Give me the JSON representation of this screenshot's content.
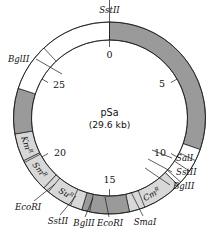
{
  "figure": {
    "kind": "plasmid-map",
    "name": "pSa",
    "size_label": "(29.6 kb)",
    "units": "kb",
    "total_kb": 29.6,
    "scale_max": 30,
    "background_color": "#ffffff",
    "line_color": "#1a1a1a"
  },
  "geometry": {
    "cx": 109.5,
    "cy": 118.0,
    "r_outer": 96.0,
    "r_inner": 78.0,
    "zero_angle_deg": -90,
    "direction": "clockwise"
  },
  "colors": {
    "dark_segment": "#9a9a9a",
    "light_segment": "#ffffff",
    "gene_segment": "#d8d8d8",
    "outline": "#1a1a1a",
    "text": "#111111"
  },
  "ticks": [
    {
      "label": "0",
      "kb": 0,
      "label_dx": 0,
      "label_dy": 11,
      "anchor": "middle"
    },
    {
      "label": "5",
      "kb": 5,
      "label_dx": -9,
      "label_dy": 4,
      "anchor": "middle"
    },
    {
      "label": "10",
      "kb": 10,
      "label_dx": -11,
      "label_dy": 2,
      "anchor": "middle"
    },
    {
      "label": "15",
      "kb": 15,
      "label_dx": 0,
      "label_dy": -6,
      "anchor": "middle"
    },
    {
      "label": "20",
      "kb": 20,
      "label_dx": 12,
      "label_dy": 2,
      "anchor": "middle"
    },
    {
      "label": "25",
      "kb": 25,
      "label_dx": 11,
      "label_dy": 5,
      "anchor": "middle"
    }
  ],
  "ring_segments": [
    {
      "name": "dark-0-to-9",
      "start_kb": 0.0,
      "end_kb": 9.1,
      "style": "dark",
      "label": null
    },
    {
      "name": "light-9-to-11",
      "start_kb": 9.1,
      "end_kb": 11.2,
      "style": "light",
      "label": null
    },
    {
      "name": "gene-cm",
      "start_kb": 11.2,
      "end_kb": 14.0,
      "style": "gene",
      "label": "Cm",
      "sup": "R"
    },
    {
      "name": "dark-14-to-16",
      "start_kb": 14.0,
      "end_kb": 16.4,
      "style": "dark",
      "label": null
    },
    {
      "name": "gene-su",
      "start_kb": 16.4,
      "end_kb": 18.6,
      "style": "gene",
      "label": "Su",
      "sup": "R"
    },
    {
      "name": "gene-sm",
      "start_kb": 18.6,
      "end_kb": 20.3,
      "style": "gene",
      "label": "Sm",
      "sup": "R"
    },
    {
      "name": "gene-km",
      "start_kb": 20.3,
      "end_kb": 21.7,
      "style": "gene",
      "label": "Km",
      "sup": "R"
    },
    {
      "name": "dark-21-to-24",
      "start_kb": 21.7,
      "end_kb": 24.0,
      "style": "dark",
      "label": null
    },
    {
      "name": "light-24-to-30",
      "start_kb": 24.0,
      "end_kb": 30.0,
      "style": "light",
      "label": null
    }
  ],
  "restriction_sites": [
    {
      "name": "sstII-top",
      "label": "SstII",
      "kb": 0.0,
      "tick_inner_r": 78,
      "tick_outer_r": 120,
      "text_x": 109.5,
      "text_y": 13,
      "anchor": "middle",
      "leader": null
    },
    {
      "name": "bglII-left",
      "label": "BglII",
      "kb": 26.4,
      "tick_inner_r": 78,
      "tick_outer_r": 96,
      "text_x": 8,
      "text_y": 62,
      "anchor": "start",
      "leader": {
        "x1": 36,
        "y1": 59,
        "x2": 62,
        "y2": 74
      }
    },
    {
      "name": "salI-right",
      "label": "SalI",
      "kb": 9.7,
      "tick_inner_r": 78,
      "tick_outer_r": 96,
      "text_x": 176,
      "text_y": 161,
      "anchor": "start",
      "leader": {
        "x1": 172,
        "y1": 158,
        "x2": 152,
        "y2": 150
      }
    },
    {
      "name": "sstII-right",
      "label": "SstII",
      "kb": 10.3,
      "tick_inner_r": 78,
      "tick_outer_r": 96,
      "text_x": 176,
      "text_y": 175,
      "anchor": "start",
      "leader": {
        "x1": 172,
        "y1": 172,
        "x2": 148,
        "y2": 159
      }
    },
    {
      "name": "bglII-right",
      "label": "BglII",
      "kb": 11.0,
      "tick_inner_r": 78,
      "tick_outer_r": 96,
      "text_x": 173,
      "text_y": 189,
      "anchor": "start",
      "leader": {
        "x1": 170,
        "y1": 185,
        "x2": 145,
        "y2": 168
      }
    },
    {
      "name": "smaI-bottom",
      "label": "SmaI",
      "kb": 13.2,
      "tick_inner_r": 78,
      "tick_outer_r": 96,
      "text_x": 145,
      "text_y": 225,
      "anchor": "middle",
      "leader": {
        "x1": 143,
        "y1": 216,
        "x2": 131,
        "y2": 192
      }
    },
    {
      "name": "ecoRI-bottom-right",
      "label": "EcoRI",
      "kb": 16.0,
      "tick_inner_r": 78,
      "tick_outer_r": 96,
      "text_x": 110,
      "text_y": 226,
      "anchor": "middle",
      "leader": {
        "x1": 109,
        "y1": 217,
        "x2": 105,
        "y2": 197
      }
    },
    {
      "name": "bglII-bottom",
      "label": "BglII",
      "kb": 17.0,
      "tick_inner_r": 78,
      "tick_outer_r": 96,
      "text_x": 84,
      "text_y": 226,
      "anchor": "middle",
      "leader": {
        "x1": 85,
        "y1": 217,
        "x2": 93,
        "y2": 198
      }
    },
    {
      "name": "sstII-bottom",
      "label": "SstII",
      "kb": 18.3,
      "tick_inner_r": 78,
      "tick_outer_r": 96,
      "text_x": 58,
      "text_y": 224,
      "anchor": "middle",
      "leader": {
        "x1": 60,
        "y1": 215,
        "x2": 76,
        "y2": 196
      }
    },
    {
      "name": "ecoRI-bottom-left",
      "label": "EcoRI",
      "kb": 20.2,
      "tick_inner_r": 78,
      "tick_outer_r": 96,
      "text_x": 28,
      "text_y": 210,
      "anchor": "middle",
      "leader": {
        "x1": 34,
        "y1": 201,
        "x2": 55,
        "y2": 184
      }
    }
  ],
  "center": {
    "title": "pSa",
    "subtitle": "(29.6 kb)"
  }
}
